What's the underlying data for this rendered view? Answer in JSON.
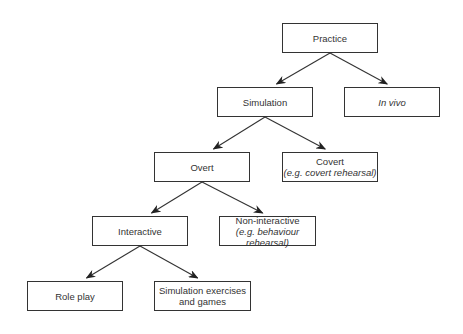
{
  "diagram": {
    "type": "tree",
    "nodes": [
      {
        "id": "practice",
        "label": "Practice",
        "sublabel": "",
        "italic": false,
        "x": 282,
        "y": 23,
        "w": 96,
        "h": 30
      },
      {
        "id": "simulation",
        "label": "Simulation",
        "sublabel": "",
        "italic": false,
        "x": 217,
        "y": 87,
        "w": 96,
        "h": 30
      },
      {
        "id": "in-vivo",
        "label": "In vivo",
        "sublabel": "",
        "italic": true,
        "x": 344,
        "y": 87,
        "w": 96,
        "h": 30
      },
      {
        "id": "overt",
        "label": "Overt",
        "sublabel": "",
        "italic": false,
        "x": 154,
        "y": 152,
        "w": 96,
        "h": 30
      },
      {
        "id": "covert",
        "label": "Covert",
        "sublabel": "(e.g. covert rehearsal)",
        "italic": false,
        "x": 282,
        "y": 152,
        "w": 96,
        "h": 30
      },
      {
        "id": "interactive",
        "label": "Interactive",
        "sublabel": "",
        "italic": false,
        "x": 92,
        "y": 216,
        "w": 96,
        "h": 30
      },
      {
        "id": "non-interactive",
        "label": "Non-interactive",
        "sublabel": "(e.g. behaviour rehearsal)",
        "italic": false,
        "x": 219,
        "y": 216,
        "w": 97,
        "h": 30
      },
      {
        "id": "role-play",
        "label": "Role play",
        "sublabel": "",
        "italic": false,
        "x": 27,
        "y": 281,
        "w": 96,
        "h": 30
      },
      {
        "id": "sim-exercises",
        "label": "Simulation exercises",
        "sublabel": "and games",
        "italic": false,
        "x": 154,
        "y": 281,
        "w": 97,
        "h": 30
      }
    ],
    "edges": [
      {
        "from": "practice",
        "to": "simulation"
      },
      {
        "from": "practice",
        "to": "in-vivo"
      },
      {
        "from": "simulation",
        "to": "overt"
      },
      {
        "from": "simulation",
        "to": "covert"
      },
      {
        "from": "overt",
        "to": "interactive"
      },
      {
        "from": "overt",
        "to": "non-interactive"
      },
      {
        "from": "interactive",
        "to": "role-play"
      },
      {
        "from": "interactive",
        "to": "sim-exercises"
      }
    ]
  }
}
